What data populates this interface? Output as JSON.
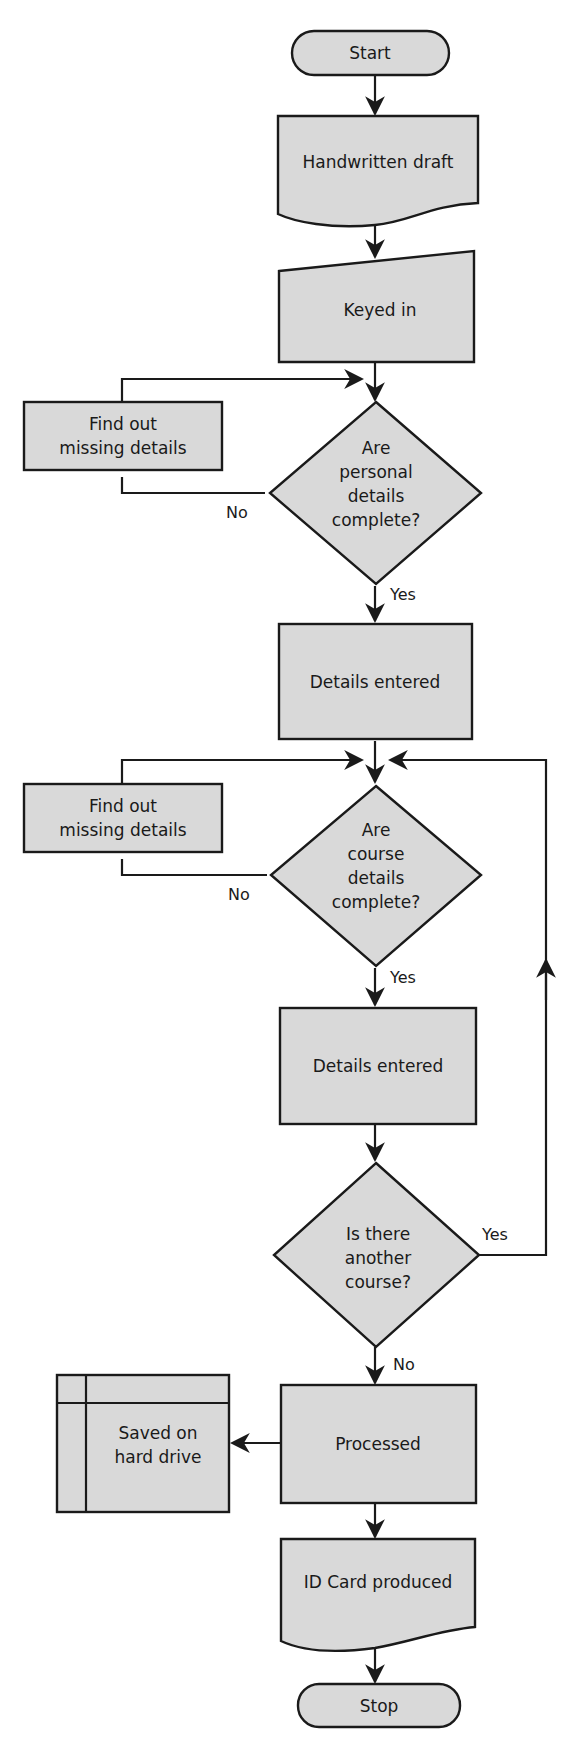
{
  "diagram": {
    "type": "flowchart",
    "colors": {
      "fill": "#d9d9d9",
      "stroke": "#1a1a1a",
      "background": "#ffffff"
    },
    "nodes": {
      "start": {
        "label": "Start",
        "shape": "terminator"
      },
      "handwritten": {
        "label": "Handwritten draft",
        "shape": "document"
      },
      "keyed": {
        "label": "Keyed in",
        "shape": "manual-input"
      },
      "missing1": {
        "line1": "Find out",
        "line2": "missing details",
        "shape": "process"
      },
      "decision1": {
        "line1": "Are",
        "line2": "personal",
        "line3": "details",
        "line4": "complete?",
        "shape": "decision"
      },
      "entered1": {
        "label": "Details entered",
        "shape": "process"
      },
      "missing2": {
        "line1": "Find out",
        "line2": "missing details",
        "shape": "process"
      },
      "decision2": {
        "line1": "Are",
        "line2": "course",
        "line3": "details",
        "line4": "complete?",
        "shape": "decision"
      },
      "entered2": {
        "label": "Details entered",
        "shape": "process"
      },
      "decision3": {
        "line1": "Is there",
        "line2": "another",
        "line3": "course?",
        "shape": "decision"
      },
      "processed": {
        "label": "Processed",
        "shape": "process"
      },
      "saved": {
        "line1": "Saved on",
        "line2": "hard drive",
        "shape": "internal-storage"
      },
      "idcard": {
        "label": "ID Card produced",
        "shape": "document"
      },
      "stop": {
        "label": "Stop",
        "shape": "terminator"
      }
    },
    "edges": {
      "d1_no": "No",
      "d1_yes": "Yes",
      "d2_no": "No",
      "d2_yes": "Yes",
      "d3_yes": "Yes",
      "d3_no": "No"
    }
  }
}
